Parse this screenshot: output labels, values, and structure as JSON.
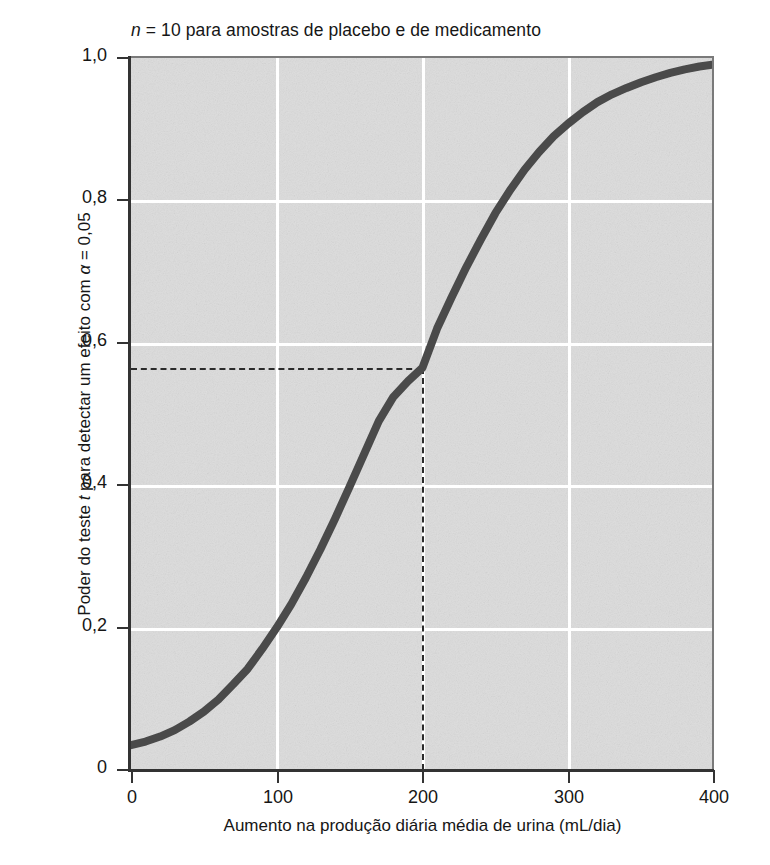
{
  "chart_data": {
    "type": "line",
    "title": "n = 10 para amostras de placebo e de medicamento",
    "title_parts": {
      "italic_symbol": "n",
      "rest": " = 10 para amostras de placebo e de medicamento"
    },
    "xlabel": "Aumento na produção diária média de urina (mL/dia)",
    "ylabel": "Poder do teste t para detectar um efeito com α = 0,05",
    "ylabel_parts": {
      "prefix": "Poder do teste ",
      "italic_symbol": "t",
      "middle": " para detectar um efeito com ",
      "alpha_symbol": "α",
      "suffix": " = 0,05"
    },
    "xlim": [
      0,
      400
    ],
    "ylim": [
      0,
      1.0
    ],
    "grid": true,
    "legend": "none",
    "xticks": [
      0,
      100,
      200,
      300,
      400
    ],
    "xtick_labels": [
      "0",
      "100",
      "200",
      "300",
      "400"
    ],
    "yticks": [
      0,
      0.2,
      0.4,
      0.6,
      0.8,
      1.0
    ],
    "ytick_labels": [
      "0",
      "0,2",
      "0,4",
      "0,6",
      "0,8",
      "1,0"
    ],
    "series": [
      {
        "name": "Poder do teste t",
        "color": "#4a4a4a",
        "line_width_px": 8,
        "x": [
          0,
          10,
          20,
          30,
          40,
          50,
          60,
          70,
          80,
          90,
          100,
          110,
          120,
          130,
          140,
          150,
          160,
          170,
          180,
          190,
          200,
          210,
          220,
          230,
          240,
          250,
          260,
          270,
          280,
          290,
          300,
          310,
          320,
          330,
          340,
          350,
          360,
          370,
          380,
          390,
          400
        ],
        "y": [
          0.035,
          0.04,
          0.047,
          0.056,
          0.068,
          0.082,
          0.099,
          0.12,
          0.142,
          0.17,
          0.2,
          0.233,
          0.27,
          0.31,
          0.353,
          0.398,
          0.444,
          0.49,
          0.524,
          0.546,
          0.565,
          0.62,
          0.664,
          0.706,
          0.745,
          0.782,
          0.814,
          0.843,
          0.868,
          0.89,
          0.908,
          0.924,
          0.938,
          0.949,
          0.958,
          0.966,
          0.973,
          0.979,
          0.984,
          0.988,
          0.991
        ]
      }
    ],
    "annotations": [
      {
        "type": "dashed-reference-lines",
        "x_value": 200,
        "y_value": 0.565,
        "description": "Linhas tracejadas indicando o poder em 200 mL/dia"
      }
    ],
    "style": {
      "panel_background": "#dcdcdc",
      "gridline_color": "#ffffff",
      "axis_color": "#333333",
      "curve_color": "#4a4a4a",
      "dash_color": "#2b2b2b",
      "figure_background": "#ffffff"
    }
  }
}
